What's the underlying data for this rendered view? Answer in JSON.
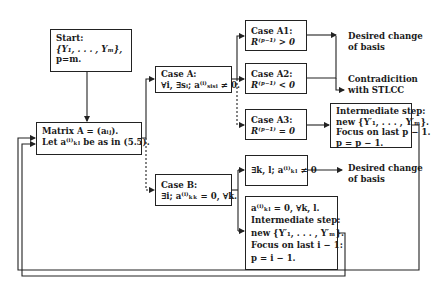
{
  "diagram": {
    "type": "flowchart",
    "nodes": {
      "start": {
        "lines": [
          "Start:",
          "{Y₁, . . . , Yₘ},",
          "p=m."
        ]
      },
      "matrix": {
        "lines": [
          "Matrix A = (aᵢⱼ).",
          "Let a⁽ⁱ⁾ₖₗ be as in (5.5)."
        ]
      },
      "case_a": {
        "lines": [
          "Case A:",
          "∀i, ∃sᵢ; a⁽ⁱ⁾ₛᵢₛᵢ ≠ 0."
        ]
      },
      "case_b": {
        "lines": [
          "Case B:",
          "∃i; a⁽ⁱ⁾ₖₖ = 0, ∀k."
        ]
      },
      "case_a1": {
        "lines": [
          "Case A1:",
          "R⁽ᵖ⁻¹⁾ > 0"
        ]
      },
      "case_a2": {
        "lines": [
          "Case A2:",
          "R⁽ᵖ⁻¹⁾ < 0"
        ]
      },
      "case_a3": {
        "lines": [
          "Case A3:",
          "R⁽ᵖ⁻¹⁾ = 0"
        ]
      },
      "intermediate_a3": {
        "lines": [
          "Intermediate step:",
          "new {Y′₁, . . . , Y′ₘ}.",
          "Focus on last p − 1.",
          "p = p − 1."
        ]
      },
      "case_b1": {
        "lines": [
          "∃k, l; a⁽ⁱ⁾ₖₗ ≠ 0"
        ]
      },
      "case_b2": {
        "lines": [
          "a⁽ⁱ⁾ₖₗ = 0, ∀k, l.",
          "Intermediate step:",
          "new {Y′₁, . . . , Y′ₘ}.",
          "Focus on last i − 1:",
          "p = i − 1."
        ]
      }
    },
    "outcomes": {
      "a1_result": {
        "lines": [
          "Desired change",
          "of basis"
        ]
      },
      "a2_result": {
        "lines": [
          "Contradicition",
          "with STLCC"
        ]
      },
      "b1_result": {
        "lines": [
          "Desired change",
          "of basis"
        ]
      }
    },
    "edges": [
      {
        "from": "start",
        "to": "matrix",
        "style": "solid"
      },
      {
        "from": "matrix",
        "to": "case_a",
        "style": "solid"
      },
      {
        "from": "matrix",
        "to": "case_b",
        "style": "dashed"
      },
      {
        "from": "case_a",
        "to": "case_a1",
        "style": "solid"
      },
      {
        "from": "case_a",
        "to": "case_a2",
        "style": "solid"
      },
      {
        "from": "case_a",
        "to": "case_a3",
        "style": "dashed"
      },
      {
        "from": "case_a1",
        "to": "a1_result",
        "style": "solid"
      },
      {
        "from": "case_a2",
        "to": "a2_result",
        "style": "solid"
      },
      {
        "from": "case_a3",
        "to": "intermediate_a3",
        "style": "solid"
      },
      {
        "from": "intermediate_a3",
        "to": "matrix",
        "style": "solid",
        "note": "loop back"
      },
      {
        "from": "case_b",
        "to": "case_b1",
        "style": "solid"
      },
      {
        "from": "case_b",
        "to": "case_b2",
        "style": "solid"
      },
      {
        "from": "case_b1",
        "to": "b1_result",
        "style": "solid"
      },
      {
        "from": "case_b2",
        "to": "matrix",
        "style": "solid",
        "note": "loop back"
      }
    ]
  }
}
